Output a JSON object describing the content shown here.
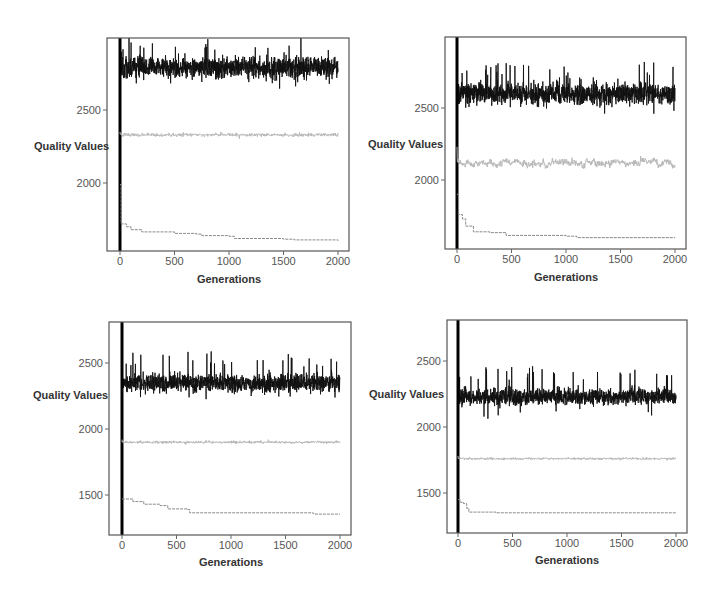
{
  "figure": {
    "panel_count": 4,
    "layout": "2x2 grid"
  },
  "colors": {
    "best_series": "#111111",
    "mean_series": "#b8b8b8",
    "min_series": "#8a8a8a",
    "frame": "#555555",
    "tick_label": "#555555"
  },
  "chart_data": [
    {
      "type": "line",
      "panel": "top-left",
      "title": "",
      "xlabel": "Generations",
      "ylabel": "Quality Values",
      "xlim": [
        -80,
        2080
      ],
      "ylim": [
        1430,
        2960
      ],
      "xticks": [
        0,
        500,
        1000,
        1500,
        2000
      ],
      "yticks": [
        2000,
        2500
      ],
      "grid": false,
      "legend": null,
      "series": [
        {
          "name": "max",
          "style": "dense-noise",
          "mean": 2790,
          "spread": 70,
          "spike": 200,
          "start": 1450
        },
        {
          "name": "mean",
          "style": "noise",
          "mean": 2330,
          "spread": 18,
          "spike": 30,
          "start": 2350
        },
        {
          "name": "min",
          "style": "step-decay",
          "points": [
            [
              0,
              1990
            ],
            [
              10,
              1720
            ],
            [
              60,
              1700
            ],
            [
              100,
              1680
            ],
            [
              200,
              1665
            ],
            [
              500,
              1655
            ],
            [
              700,
              1650
            ],
            [
              750,
              1640
            ],
            [
              1000,
              1635
            ],
            [
              1050,
              1620
            ],
            [
              1500,
              1615
            ],
            [
              1600,
              1610
            ],
            [
              2000,
              1605
            ]
          ]
        }
      ],
      "frame_px": {
        "x": 107,
        "y": 38,
        "w": 242,
        "h": 213
      },
      "x0_px": 120,
      "x2000_px": 338,
      "y_ref": [
        [
          2500,
          110
        ],
        [
          2000,
          183
        ]
      ],
      "ylabel_px": {
        "x": 34,
        "y": 150
      },
      "xlabel_px": {
        "x": 229,
        "y": 283
      },
      "tick_label_y": 265
    },
    {
      "type": "line",
      "panel": "top-right",
      "title": "",
      "xlabel": "Generations",
      "ylabel": "Quality Values",
      "xlim": [
        -80,
        2080
      ],
      "ylim": [
        1580,
        2970
      ],
      "xticks": [
        0,
        500,
        1000,
        1500,
        2000
      ],
      "yticks": [
        2000,
        2500
      ],
      "grid": false,
      "legend": null,
      "series": [
        {
          "name": "max",
          "style": "dense-noise",
          "mean": 2600,
          "spread": 70,
          "spike": 200,
          "start": 1600
        },
        {
          "name": "mean",
          "style": "noise-wander",
          "mean": 2120,
          "spread": 30,
          "spike": 40,
          "start": 2230
        },
        {
          "name": "min",
          "style": "step-decay",
          "points": [
            [
              0,
              1900
            ],
            [
              15,
              1760
            ],
            [
              50,
              1730
            ],
            [
              80,
              1680
            ],
            [
              150,
              1640
            ],
            [
              300,
              1635
            ],
            [
              450,
              1615
            ],
            [
              1000,
              1610
            ],
            [
              1100,
              1600
            ],
            [
              2000,
              1598
            ]
          ]
        }
      ],
      "frame_px": {
        "x": 445,
        "y": 37,
        "w": 241,
        "h": 212
      },
      "x0_px": 457,
      "x2000_px": 675,
      "y_ref": [
        [
          2500,
          108
        ],
        [
          2000,
          180
        ]
      ],
      "ylabel_px": {
        "x": 368,
        "y": 148
      },
      "xlabel_px": {
        "x": 566,
        "y": 281
      },
      "tick_label_y": 263
    },
    {
      "type": "line",
      "panel": "bottom-left",
      "title": "",
      "xlabel": "Generations",
      "ylabel": "Quality Values",
      "xlim": [
        -80,
        2080
      ],
      "ylim": [
        1200,
        2800
      ],
      "xticks": [
        0,
        500,
        1000,
        1500,
        2000
      ],
      "yticks": [
        1500,
        2000,
        2500
      ],
      "grid": false,
      "legend": null,
      "series": [
        {
          "name": "max",
          "style": "dense-noise",
          "mean": 2350,
          "spread": 65,
          "spike": 220,
          "start": 1250
        },
        {
          "name": "mean",
          "style": "noise",
          "mean": 1900,
          "spread": 16,
          "spike": 30,
          "start": 1920
        },
        {
          "name": "min",
          "style": "step-decay",
          "points": [
            [
              0,
              1470
            ],
            [
              100,
              1450
            ],
            [
              200,
              1430
            ],
            [
              350,
              1420
            ],
            [
              420,
              1395
            ],
            [
              600,
              1390
            ],
            [
              620,
              1365
            ],
            [
              1750,
              1362
            ],
            [
              1760,
              1355
            ],
            [
              2000,
              1355
            ]
          ]
        }
      ],
      "frame_px": {
        "x": 109,
        "y": 322,
        "w": 242,
        "h": 213
      },
      "x0_px": 122,
      "x2000_px": 340,
      "y_ref": [
        [
          2500,
          363
        ],
        [
          2000,
          429
        ]
      ],
      "ylabel_px": {
        "x": 33,
        "y": 399
      },
      "xlabel_px": {
        "x": 231,
        "y": 566
      },
      "tick_label_y": 549
    },
    {
      "type": "line",
      "panel": "bottom-right",
      "title": "",
      "xlabel": "Generations",
      "ylabel": "Quality Values",
      "xlim": [
        -80,
        2080
      ],
      "ylim": [
        1200,
        2800
      ],
      "xticks": [
        0,
        500,
        1000,
        1500,
        2000
      ],
      "yticks": [
        1500,
        2000,
        2500
      ],
      "grid": false,
      "legend": null,
      "series": [
        {
          "name": "max",
          "style": "dense-noise",
          "mean": 2230,
          "spread": 60,
          "spike": 220,
          "start": 1250
        },
        {
          "name": "mean",
          "style": "noise",
          "mean": 1760,
          "spread": 14,
          "spike": 25,
          "start": 1780
        },
        {
          "name": "min",
          "style": "step-decay",
          "points": [
            [
              0,
              1450
            ],
            [
              20,
              1430
            ],
            [
              50,
              1420
            ],
            [
              80,
              1385
            ],
            [
              100,
              1355
            ],
            [
              350,
              1350
            ],
            [
              2000,
              1350
            ]
          ]
        }
      ],
      "frame_px": {
        "x": 447,
        "y": 320,
        "w": 240,
        "h": 213
      },
      "x0_px": 458,
      "x2000_px": 676,
      "y_ref": [
        [
          2500,
          361
        ],
        [
          2000,
          427
        ]
      ],
      "ylabel_px": {
        "x": 369,
        "y": 398
      },
      "xlabel_px": {
        "x": 567,
        "y": 564
      },
      "tick_label_y": 547
    }
  ]
}
